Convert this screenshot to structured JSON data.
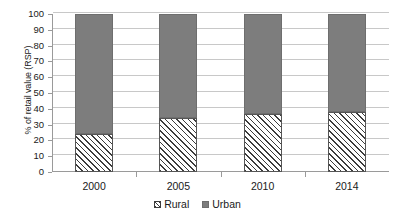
{
  "chart_data": {
    "type": "bar",
    "subtype": "stacked-bar-100",
    "title": "",
    "xlabel": "",
    "ylabel": "% of retail value (RSP)",
    "categories": [
      "2000",
      "2005",
      "2010",
      "2014"
    ],
    "series": [
      {
        "name": "Rural",
        "values": [
          24,
          34,
          37,
          38
        ],
        "color": "#ffffff",
        "pattern": "diagonal-hatch"
      },
      {
        "name": "Urban",
        "values": [
          76,
          66,
          63,
          62
        ],
        "color": "#7d7d7d",
        "pattern": "solid"
      }
    ],
    "ylim": [
      0,
      100
    ],
    "ytick_values": [
      0,
      10,
      20,
      30,
      40,
      50,
      60,
      70,
      80,
      90,
      100
    ],
    "ytick_labels": [
      "0",
      "10",
      "20",
      "30",
      "40",
      "50",
      "60",
      "70",
      "80",
      "90",
      "100"
    ],
    "grid": true,
    "grid_axis": "y",
    "legend": [
      "Rural",
      "Urban"
    ],
    "legend_position": "bottom-center"
  },
  "axes": {
    "y_title": "% of retail value (RSP)"
  },
  "legend": {
    "items": [
      {
        "label": "Rural",
        "icon": "hatched-square-swatch"
      },
      {
        "label": "Urban",
        "icon": "gray-square-swatch"
      }
    ]
  }
}
